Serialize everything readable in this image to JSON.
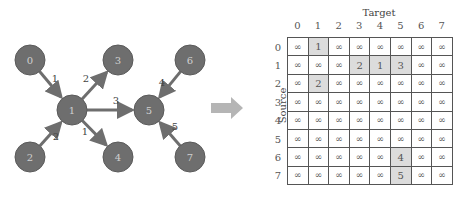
{
  "graph": {
    "node_fill": "#6e6e6e",
    "node_stroke": "#5a5a5a",
    "node_text_color": "#d0d0d0",
    "edge_color": "#6e6e6e",
    "nodes": [
      {
        "id": "0",
        "x": 30,
        "y": 60
      },
      {
        "id": "1",
        "x": 72,
        "y": 110
      },
      {
        "id": "2",
        "x": 30,
        "y": 157
      },
      {
        "id": "3",
        "x": 118,
        "y": 60
      },
      {
        "id": "4",
        "x": 118,
        "y": 157
      },
      {
        "id": "5",
        "x": 149,
        "y": 110
      },
      {
        "id": "6",
        "x": 190,
        "y": 60
      },
      {
        "id": "7",
        "x": 190,
        "y": 157
      }
    ],
    "edges": [
      {
        "from": "0",
        "to": "1",
        "weight": "1",
        "lx": 55,
        "ly": 82
      },
      {
        "from": "1",
        "to": "3",
        "weight": "2",
        "lx": 86,
        "ly": 82
      },
      {
        "from": "1",
        "to": "5",
        "weight": "3",
        "lx": 116,
        "ly": 104
      },
      {
        "from": "2",
        "to": "1",
        "weight": "2",
        "lx": 56,
        "ly": 140
      },
      {
        "from": "1",
        "to": "4",
        "weight": "1",
        "lx": 85,
        "ly": 135
      },
      {
        "from": "6",
        "to": "5",
        "weight": "4",
        "lx": 162,
        "ly": 86
      },
      {
        "from": "7",
        "to": "5",
        "weight": "5",
        "lx": 175,
        "ly": 130
      }
    ]
  },
  "arrow": {
    "color": "#b5b5b5"
  },
  "matrix": {
    "target_title": "Target",
    "source_title": "Source",
    "col_labels": [
      "0",
      "1",
      "2",
      "3",
      "4",
      "5",
      "6",
      "7"
    ],
    "row_labels": [
      "0",
      "1",
      "2",
      "3",
      "4",
      "5",
      "6",
      "7"
    ],
    "highlight_color": "#dcdcdc",
    "rows": [
      [
        "∞",
        "1",
        "∞",
        "∞",
        "∞",
        "∞",
        "∞",
        "∞"
      ],
      [
        "∞",
        "∞",
        "∞",
        "2",
        "1",
        "3",
        "∞",
        "∞"
      ],
      [
        "∞",
        "2",
        "∞",
        "∞",
        "∞",
        "∞",
        "∞",
        "∞"
      ],
      [
        "∞",
        "∞",
        "∞",
        "∞",
        "∞",
        "∞",
        "∞",
        "∞"
      ],
      [
        "∞",
        "∞",
        "∞",
        "∞",
        "∞",
        "∞",
        "∞",
        "∞"
      ],
      [
        "∞",
        "∞",
        "∞",
        "∞",
        "∞",
        "∞",
        "∞",
        "∞"
      ],
      [
        "∞",
        "∞",
        "∞",
        "∞",
        "∞",
        "4",
        "∞",
        "∞"
      ],
      [
        "∞",
        "∞",
        "∞",
        "∞",
        "∞",
        "5",
        "∞",
        "∞"
      ]
    ]
  }
}
